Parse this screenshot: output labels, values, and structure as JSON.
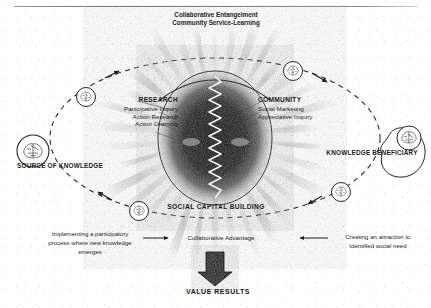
{
  "figure": {
    "title_top": {
      "line1": "Collaborative Entangelment",
      "line2": "Community Service-Learning"
    },
    "center": {
      "core_label": "radiating-sunburst-core",
      "wave_label": "zigzag-energy-exchange"
    },
    "left_domain": {
      "heading": "RESEARCH",
      "items": [
        "Participative Inquiry",
        "Action Research",
        "Action Learning"
      ]
    },
    "right_domain": {
      "heading": "COMMUNITY",
      "items": [
        "Social Marketing",
        "Appreciative Inquiry"
      ]
    },
    "bottom_core_label": "SOCIAL CAPITAL BUILDING",
    "poles": {
      "left": {
        "label": "SOURCE OF KNOWLEDGE",
        "icon": "brain-circle-icon"
      },
      "right": {
        "label": "KNOWLEDGE BENEFICIARY",
        "icon": "brain-head-icon"
      }
    },
    "orbit_nodes": [
      {
        "icon": "brain-circle-icon",
        "position": "upper-left"
      },
      {
        "icon": "brain-circle-icon",
        "position": "upper-right"
      },
      {
        "icon": "brain-circle-icon",
        "position": "lower-right"
      },
      {
        "icon": "brain-circle-icon",
        "position": "lower-left"
      }
    ],
    "flow_row": {
      "left_text": {
        "line1": "Implementing a participatory",
        "line2": "process where new knowledge",
        "line3": "emerges"
      },
      "center_text": "Collaborative Advantage",
      "right_text": {
        "line1": "Creating an attraction to",
        "line2": "Identified social need"
      },
      "left_arrow": "arrow-right-icon",
      "right_arrow": "arrow-left-icon"
    },
    "outcome": {
      "arrow": "thick-arrow-down-icon",
      "label": "VALUE RESULTS"
    },
    "colors": {
      "ink": "#1c1c1c",
      "line": "#2b2b2b",
      "core_dark": "#1a1a1a",
      "paper": "#ffffff",
      "rule": "#808080"
    }
  }
}
